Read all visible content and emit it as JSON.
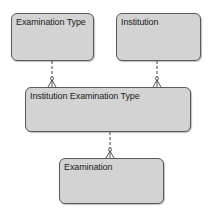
{
  "diagram": {
    "type": "entity-relationship",
    "entities": [
      {
        "id": "examination_type",
        "label": "Examination Type"
      },
      {
        "id": "institution",
        "label": "Institution"
      },
      {
        "id": "institution_examination_type",
        "label": "Institution Examination Type"
      },
      {
        "id": "examination",
        "label": "Examination"
      }
    ],
    "relationships": [
      {
        "from": "examination_type",
        "to": "institution_examination_type",
        "cardinality_from": "one",
        "cardinality_to": "zero-or-many",
        "line": "dashed"
      },
      {
        "from": "institution",
        "to": "institution_examination_type",
        "cardinality_from": "one",
        "cardinality_to": "zero-or-many",
        "line": "dashed"
      },
      {
        "from": "institution_examination_type",
        "to": "examination",
        "cardinality_from": "one",
        "cardinality_to": "zero-or-many",
        "line": "dashed"
      }
    ],
    "colors": {
      "entity_fill": "#d3d3d3",
      "entity_border": "#5a5a5a",
      "connector": "#444444"
    }
  }
}
